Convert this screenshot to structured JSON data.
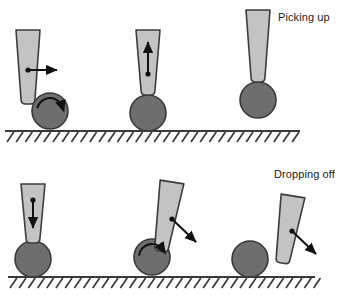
{
  "figure": {
    "title": "",
    "width": 349,
    "height": 296,
    "background": "#ffffff"
  },
  "labels": {
    "picking_up": "Picking up",
    "dropping_off": "Dropping off"
  },
  "colors": {
    "gripper_fill": "#c3c3c3",
    "gripper_stroke": "#3c3c3c",
    "ball_fill": "#6e6e6e",
    "ball_stroke": "#3a3a3a",
    "ground_line": "#3a3a3a",
    "arrow": "#111111",
    "text": "#1a1a1a"
  },
  "sequences": [
    {
      "name": "picking-up",
      "label": "Picking up",
      "ground": {
        "y": 131,
        "x_start": 5,
        "x_end": 300
      },
      "frames": [
        {
          "name": "picking-up-frame-1",
          "description": "Gripper pushes sideways, ball rolls",
          "gripper": {
            "cx": 28,
            "top_y": 30,
            "bottom_y": 104,
            "top_half_width": 12,
            "bottom_half_width": 7,
            "rotation_deg": 0
          },
          "ball": {
            "cx": 50,
            "cy": 111,
            "r": 18
          },
          "arrows": [
            {
              "type": "straight",
              "name": "horizontal-right-arrow",
              "x1": 28,
              "y1": 70,
              "x2": 57,
              "y2": 70
            }
          ],
          "rotation_arrow": {
            "name": "ball-rotation-arrow",
            "cx": 50,
            "cy": 111,
            "r": 13,
            "start_deg": 192,
            "sweep_deg": 150
          }
        },
        {
          "name": "picking-up-frame-2",
          "description": "Gripper lifts straight up with ball captured",
          "gripper": {
            "cx": 148,
            "top_y": 30,
            "bottom_y": 95,
            "top_half_width": 12,
            "bottom_half_width": 7,
            "rotation_deg": 0
          },
          "ball": {
            "cx": 148,
            "cy": 113,
            "r": 18
          },
          "arrows": [
            {
              "type": "straight",
              "name": "vertical-up-arrow",
              "x1": 148,
              "y1": 74,
              "x2": 148,
              "y2": 42
            }
          ],
          "rotation_arrow": null
        },
        {
          "name": "picking-up-frame-3",
          "description": "Ball lifted clear of the ground",
          "gripper": {
            "cx": 258,
            "top_y": 10,
            "bottom_y": 82,
            "top_half_width": 12,
            "bottom_half_width": 7,
            "rotation_deg": 0
          },
          "ball": {
            "cx": 258,
            "cy": 100,
            "r": 18
          },
          "arrows": [],
          "rotation_arrow": null
        }
      ]
    },
    {
      "name": "dropping-off",
      "label": "Dropping off",
      "ground": {
        "y": 277,
        "x_start": 8,
        "x_end": 315
      },
      "frames": [
        {
          "name": "dropping-off-frame-1",
          "description": "Gripper lowers ball straight down",
          "gripper": {
            "cx": 33,
            "top_y": 184,
            "bottom_y": 243,
            "top_half_width": 12,
            "bottom_half_width": 7,
            "rotation_deg": 0
          },
          "ball": {
            "cx": 33,
            "cy": 259,
            "r": 18
          },
          "arrows": [
            {
              "type": "straight",
              "name": "vertical-down-arrow",
              "x1": 33,
              "y1": 200,
              "x2": 33,
              "y2": 228
            }
          ],
          "rotation_arrow": null
        },
        {
          "name": "dropping-off-frame-2",
          "description": "Gripper pulls away diagonally, ball rolls free",
          "gripper": {
            "cx": 172,
            "top_y": 182,
            "bottom_y": 252,
            "top_half_width": 12,
            "bottom_half_width": 7,
            "rotation_deg": 9
          },
          "ball": {
            "cx": 152,
            "cy": 257,
            "r": 18
          },
          "arrows": [
            {
              "type": "straight",
              "name": "diagonal-down-right-arrow",
              "x1": 172,
              "y1": 219,
              "x2": 196,
              "y2": 242
            }
          ],
          "rotation_arrow": {
            "name": "ball-rotation-arrow",
            "cx": 152,
            "cy": 257,
            "r": 13,
            "start_deg": 186,
            "sweep_deg": 140
          }
        },
        {
          "name": "dropping-off-frame-3",
          "description": "Gripper retreats diagonally, ball rests on ground",
          "gripper": {
            "cx": 293,
            "top_y": 196,
            "bottom_y": 264,
            "top_half_width": 12,
            "bottom_half_width": 7,
            "rotation_deg": 9
          },
          "ball": {
            "cx": 250,
            "cy": 259,
            "r": 18
          },
          "arrows": [
            {
              "type": "straight",
              "name": "diagonal-down-right-arrow",
              "x1": 292,
              "y1": 231,
              "x2": 316,
              "y2": 254
            }
          ],
          "rotation_arrow": null
        }
      ]
    }
  ]
}
